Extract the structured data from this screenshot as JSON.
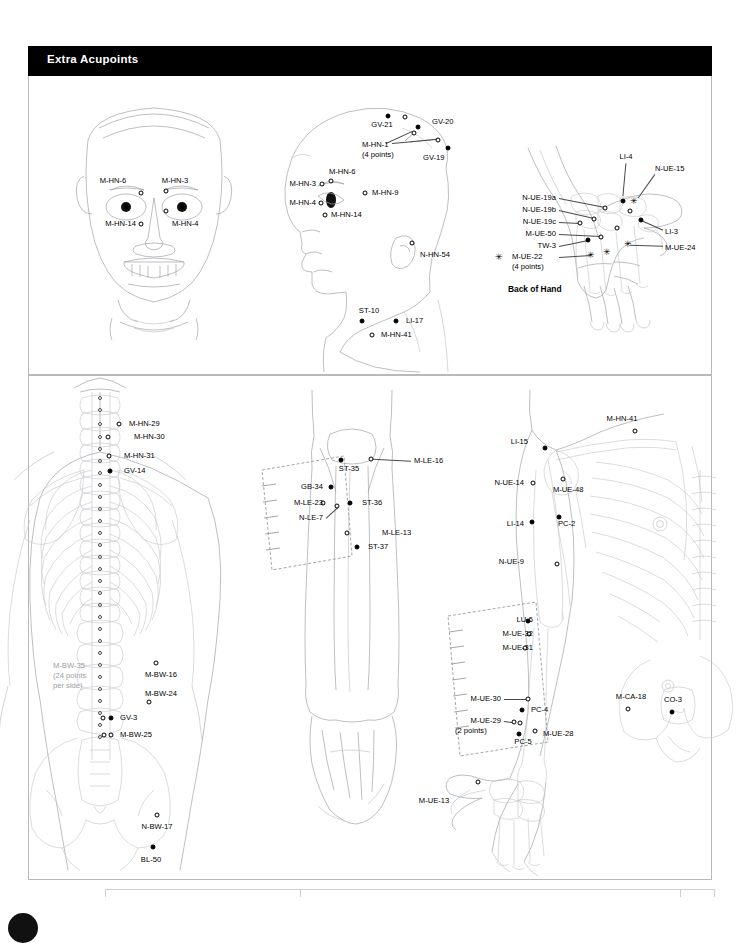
{
  "header": {
    "title": "Extra Acupoints"
  },
  "captions": {
    "back_of_hand": "Back of Hand"
  },
  "panels": {
    "top": {
      "name": "head-face-hand-panel"
    },
    "bottom": {
      "name": "back-leg-arm-panel"
    }
  },
  "face_diagram": {
    "name": "frontal-face",
    "labels": [
      {
        "text": "M-HN-6",
        "x": 113,
        "y": 181,
        "align": "c"
      },
      {
        "text": "M-HN-3",
        "x": 175,
        "y": 181,
        "align": "c"
      },
      {
        "text": "M-HN-14",
        "x": 136,
        "y": 224,
        "align": "r"
      },
      {
        "text": "M-HN-4",
        "x": 172,
        "y": 224,
        "align": "l"
      }
    ],
    "points": [
      {
        "type": "open",
        "x": 141,
        "y": 193
      },
      {
        "type": "open",
        "x": 166,
        "y": 191
      },
      {
        "type": "open",
        "x": 166,
        "y": 211
      },
      {
        "type": "open",
        "x": 141,
        "y": 224
      },
      {
        "type": "filled",
        "x": 126,
        "y": 207
      },
      {
        "type": "filled",
        "x": 182,
        "y": 207
      }
    ]
  },
  "profile_head_diagram": {
    "name": "lateral-head",
    "labels": [
      {
        "text": "GV-21",
        "x": 382,
        "y": 125,
        "align": "c"
      },
      {
        "text": "GV-20",
        "x": 432,
        "y": 122,
        "align": "l"
      },
      {
        "text": "GV-19",
        "x": 423,
        "y": 158,
        "align": "l"
      },
      {
        "text": "M-HN-1",
        "x": 362,
        "y": 145,
        "align": "l"
      },
      {
        "text": "(4 points)",
        "x": 362,
        "y": 155,
        "align": "l"
      },
      {
        "text": "M-HN-6",
        "x": 329,
        "y": 172,
        "align": "l"
      },
      {
        "text": "M-HN-3",
        "x": 316,
        "y": 184,
        "align": "r"
      },
      {
        "text": "M-HN-4",
        "x": 316,
        "y": 203,
        "align": "r"
      },
      {
        "text": "M-HN-9",
        "x": 372,
        "y": 193,
        "align": "l"
      },
      {
        "text": "M-HN-14",
        "x": 331,
        "y": 215,
        "align": "l"
      },
      {
        "text": "N-HN-54",
        "x": 420,
        "y": 255,
        "align": "l"
      },
      {
        "text": "ST-10",
        "x": 369,
        "y": 311,
        "align": "c"
      },
      {
        "text": "LI-17",
        "x": 406,
        "y": 321,
        "align": "l"
      },
      {
        "text": "M-HN-41",
        "x": 381,
        "y": 335,
        "align": "l"
      }
    ],
    "points": [
      {
        "type": "filled",
        "x": 388,
        "y": 116
      },
      {
        "type": "open",
        "x": 405,
        "y": 117
      },
      {
        "type": "filled",
        "x": 418,
        "y": 127
      },
      {
        "type": "open",
        "x": 414,
        "y": 133
      },
      {
        "type": "open",
        "x": 438,
        "y": 140
      },
      {
        "type": "filled",
        "x": 448,
        "y": 148
      },
      {
        "type": "open",
        "x": 322,
        "y": 184
      },
      {
        "type": "open",
        "x": 331,
        "y": 181
      },
      {
        "type": "open",
        "x": 321,
        "y": 203
      },
      {
        "type": "open",
        "x": 365,
        "y": 193
      },
      {
        "type": "open",
        "x": 325,
        "y": 215
      },
      {
        "type": "open",
        "x": 412,
        "y": 243
      },
      {
        "type": "filled",
        "x": 362,
        "y": 321
      },
      {
        "type": "filled",
        "x": 396,
        "y": 321
      },
      {
        "type": "open",
        "x": 372,
        "y": 335
      }
    ]
  },
  "hand_diagram": {
    "name": "back-of-hand",
    "labels": [
      {
        "text": "LI-4",
        "x": 626,
        "y": 157,
        "align": "c"
      },
      {
        "text": "N-UE-15",
        "x": 655,
        "y": 169,
        "align": "l"
      },
      {
        "text": "N-UE-19a",
        "x": 556,
        "y": 198,
        "align": "r"
      },
      {
        "text": "N-UE-19b",
        "x": 556,
        "y": 210,
        "align": "r"
      },
      {
        "text": "N-UE-19c",
        "x": 556,
        "y": 222,
        "align": "r"
      },
      {
        "text": "M-UE-50",
        "x": 556,
        "y": 234,
        "align": "r"
      },
      {
        "text": "TW-3",
        "x": 556,
        "y": 246,
        "align": "r"
      },
      {
        "text": "M-UE-22",
        "x": 512,
        "y": 257,
        "align": "l"
      },
      {
        "text": "(4 points)",
        "x": 512,
        "y": 267,
        "align": "l"
      },
      {
        "text": "LI-3",
        "x": 665,
        "y": 232,
        "align": "l"
      },
      {
        "text": "M-UE-24",
        "x": 665,
        "y": 248,
        "align": "l"
      }
    ],
    "points": [
      {
        "type": "filled",
        "x": 623,
        "y": 201
      },
      {
        "type": "star",
        "x": 634,
        "y": 201
      },
      {
        "type": "open",
        "x": 630,
        "y": 211
      },
      {
        "type": "filled",
        "x": 641,
        "y": 220
      },
      {
        "type": "open",
        "x": 605,
        "y": 208
      },
      {
        "type": "open",
        "x": 594,
        "y": 219
      },
      {
        "type": "open",
        "x": 580,
        "y": 223
      },
      {
        "type": "open",
        "x": 617,
        "y": 228
      },
      {
        "type": "open",
        "x": 601,
        "y": 237
      },
      {
        "type": "filled",
        "x": 588,
        "y": 240
      },
      {
        "type": "star",
        "x": 628,
        "y": 244
      },
      {
        "type": "star",
        "x": 607,
        "y": 252
      },
      {
        "type": "star",
        "x": 591,
        "y": 255
      },
      {
        "type": "star",
        "x": 499,
        "y": 257
      }
    ]
  },
  "back_diagram": {
    "name": "posterior-trunk",
    "labels": [
      {
        "text": "M-HN-29",
        "x": 129,
        "y": 424,
        "align": "l"
      },
      {
        "text": "M-HN-30",
        "x": 134,
        "y": 437,
        "align": "l"
      },
      {
        "text": "M-HN-31",
        "x": 124,
        "y": 456,
        "align": "l"
      },
      {
        "text": "GV-14",
        "x": 124,
        "y": 471,
        "align": "l"
      },
      {
        "text": "M-BW-35",
        "x": 53,
        "y": 666,
        "align": "l"
      },
      {
        "text": "(24 points",
        "x": 53,
        "y": 676,
        "align": "l"
      },
      {
        "text": "per side)",
        "x": 53,
        "y": 686,
        "align": "l"
      },
      {
        "text": "M-BW-16",
        "x": 145,
        "y": 675,
        "align": "l"
      },
      {
        "text": "M-BW-24",
        "x": 145,
        "y": 694,
        "align": "l"
      },
      {
        "text": "GV-3",
        "x": 120,
        "y": 718,
        "align": "l"
      },
      {
        "text": "M-BW-25",
        "x": 120,
        "y": 735,
        "align": "l"
      },
      {
        "text": "N-BW-17",
        "x": 157,
        "y": 827,
        "align": "c"
      },
      {
        "text": "BL-50",
        "x": 151,
        "y": 860,
        "align": "c"
      }
    ],
    "points": [
      {
        "type": "open",
        "x": 119,
        "y": 424
      },
      {
        "type": "open",
        "x": 108,
        "y": 437
      },
      {
        "type": "open",
        "x": 109,
        "y": 456
      },
      {
        "type": "filled",
        "x": 110,
        "y": 471
      },
      {
        "type": "open",
        "x": 156,
        "y": 663
      },
      {
        "type": "open",
        "x": 149,
        "y": 702
      },
      {
        "type": "filled",
        "x": 111,
        "y": 718
      },
      {
        "type": "open",
        "x": 103,
        "y": 718
      },
      {
        "type": "open",
        "x": 111,
        "y": 735
      },
      {
        "type": "open",
        "x": 104,
        "y": 735
      },
      {
        "type": "open",
        "x": 157,
        "y": 815
      },
      {
        "type": "filled",
        "x": 153,
        "y": 847
      }
    ],
    "spine_points_x": 100,
    "spine_points_y": [
      398,
      410,
      424,
      437,
      449,
      461,
      473,
      485,
      497,
      509,
      521,
      533,
      545,
      557,
      569,
      581,
      593,
      605,
      617,
      629,
      641,
      653,
      665,
      677,
      689,
      701,
      713,
      725,
      737
    ]
  },
  "leg_diagram": {
    "name": "anterior-leg",
    "labels": [
      {
        "text": "ST-35",
        "x": 349,
        "y": 469,
        "align": "c"
      },
      {
        "text": "M-LE-16",
        "x": 414,
        "y": 461,
        "align": "l"
      },
      {
        "text": "GB-34",
        "x": 323,
        "y": 487,
        "align": "r"
      },
      {
        "text": "M-LE-23",
        "x": 323,
        "y": 503,
        "align": "r"
      },
      {
        "text": "N-LE-7",
        "x": 323,
        "y": 518,
        "align": "r"
      },
      {
        "text": "ST-36",
        "x": 362,
        "y": 503,
        "align": "l"
      },
      {
        "text": "M-LE-13",
        "x": 382,
        "y": 533,
        "align": "l"
      },
      {
        "text": "ST-37",
        "x": 368,
        "y": 547,
        "align": "l"
      }
    ],
    "points": [
      {
        "type": "filled",
        "x": 341,
        "y": 460
      },
      {
        "type": "open",
        "x": 371,
        "y": 459
      },
      {
        "type": "filled",
        "x": 331,
        "y": 487
      },
      {
        "type": "open",
        "x": 323,
        "y": 503
      },
      {
        "type": "open",
        "x": 337,
        "y": 506
      },
      {
        "type": "filled",
        "x": 350,
        "y": 503
      },
      {
        "type": "open",
        "x": 347,
        "y": 533
      },
      {
        "type": "filled",
        "x": 357,
        "y": 547
      }
    ]
  },
  "arm_diagram": {
    "name": "anterior-arm-torso",
    "labels": [
      {
        "text": "M-HN-41",
        "x": 622,
        "y": 419,
        "align": "c"
      },
      {
        "text": "LI-15",
        "x": 528,
        "y": 442,
        "align": "r"
      },
      {
        "text": "N-UE-14",
        "x": 524,
        "y": 483,
        "align": "r"
      },
      {
        "text": "M-UE-48",
        "x": 553,
        "y": 490,
        "align": "l"
      },
      {
        "text": "LI-14",
        "x": 524,
        "y": 524,
        "align": "r"
      },
      {
        "text": "PC-2",
        "x": 558,
        "y": 524,
        "align": "l"
      },
      {
        "text": "N-UE-9",
        "x": 524,
        "y": 562,
        "align": "r"
      },
      {
        "text": "LU-5",
        "x": 533,
        "y": 620,
        "align": "r"
      },
      {
        "text": "M-UE-32",
        "x": 533,
        "y": 634,
        "align": "r"
      },
      {
        "text": "M-UE-31",
        "x": 533,
        "y": 648,
        "align": "r"
      },
      {
        "text": "M-UE-30",
        "x": 501,
        "y": 699,
        "align": "r"
      },
      {
        "text": "PC-4",
        "x": 531,
        "y": 710,
        "align": "l"
      },
      {
        "text": "M-UE-29",
        "x": 501,
        "y": 721,
        "align": "r"
      },
      {
        "text": "(2 points)",
        "x": 455,
        "y": 731,
        "align": "l"
      },
      {
        "text": "PC-5",
        "x": 523,
        "y": 742,
        "align": "c"
      },
      {
        "text": "M-UE-28",
        "x": 543,
        "y": 734,
        "align": "l"
      },
      {
        "text": "M-CA-18",
        "x": 631,
        "y": 697,
        "align": "c"
      },
      {
        "text": "CO-3",
        "x": 673,
        "y": 700,
        "align": "c"
      },
      {
        "text": "M-UE-13",
        "x": 434,
        "y": 801,
        "align": "c"
      }
    ],
    "points": [
      {
        "type": "open",
        "x": 635,
        "y": 431
      },
      {
        "type": "filled",
        "x": 545,
        "y": 448
      },
      {
        "type": "open",
        "x": 533,
        "y": 483
      },
      {
        "type": "open",
        "x": 563,
        "y": 479
      },
      {
        "type": "filled",
        "x": 532,
        "y": 522
      },
      {
        "type": "filled",
        "x": 559,
        "y": 517
      },
      {
        "type": "open",
        "x": 557,
        "y": 564
      },
      {
        "type": "filled",
        "x": 528,
        "y": 621
      },
      {
        "type": "open",
        "x": 529,
        "y": 634
      },
      {
        "type": "open",
        "x": 525,
        "y": 648
      },
      {
        "type": "open",
        "x": 528,
        "y": 699
      },
      {
        "type": "filled",
        "x": 522,
        "y": 710
      },
      {
        "type": "open",
        "x": 514,
        "y": 722
      },
      {
        "type": "open",
        "x": 520,
        "y": 723
      },
      {
        "type": "filled",
        "x": 519,
        "y": 734
      },
      {
        "type": "open",
        "x": 535,
        "y": 731
      },
      {
        "type": "open",
        "x": 628,
        "y": 709
      },
      {
        "type": "filled",
        "x": 672,
        "y": 712
      },
      {
        "type": "open",
        "x": 478,
        "y": 782
      }
    ]
  },
  "leaders": [
    {
      "x1": 626,
      "y1": 163,
      "x2": 623,
      "y2": 196
    },
    {
      "x1": 655,
      "y1": 174,
      "x2": 638,
      "y2": 198
    },
    {
      "x1": 559,
      "y1": 198,
      "x2": 605,
      "y2": 207
    },
    {
      "x1": 559,
      "y1": 210,
      "x2": 594,
      "y2": 218
    },
    {
      "x1": 559,
      "y1": 222,
      "x2": 580,
      "y2": 223
    },
    {
      "x1": 559,
      "y1": 234,
      "x2": 601,
      "y2": 236
    },
    {
      "x1": 559,
      "y1": 246,
      "x2": 588,
      "y2": 240
    },
    {
      "x1": 559,
      "y1": 257,
      "x2": 591,
      "y2": 255
    },
    {
      "x1": 663,
      "y1": 230,
      "x2": 643,
      "y2": 221
    },
    {
      "x1": 663,
      "y1": 246,
      "x2": 630,
      "y2": 245
    },
    {
      "x1": 411,
      "y1": 461,
      "x2": 373,
      "y2": 459
    },
    {
      "x1": 326,
      "y1": 518,
      "x2": 338,
      "y2": 507
    },
    {
      "x1": 504,
      "y1": 699,
      "x2": 526,
      "y2": 699
    },
    {
      "x1": 504,
      "y1": 721,
      "x2": 512,
      "y2": 722
    },
    {
      "x1": 386,
      "y1": 143,
      "x2": 412,
      "y2": 131
    },
    {
      "x1": 392,
      "y1": 143,
      "x2": 436,
      "y2": 139
    }
  ]
}
